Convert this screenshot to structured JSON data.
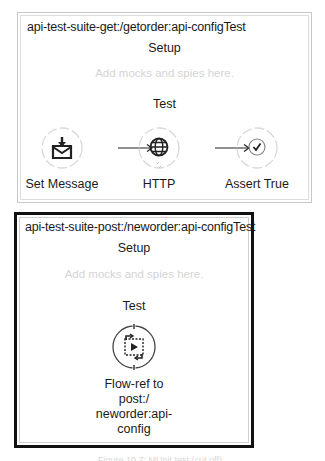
{
  "panels": [
    {
      "title": "api-test-suite-get:/getorder:api-configTest",
      "setup_label": "Setup",
      "setup_hint": "Add mocks and spies here.",
      "test_label": "Test",
      "steps": [
        {
          "label": "Set Message",
          "icon": "set-message-icon"
        },
        {
          "label": "HTTP",
          "icon": "globe-icon"
        },
        {
          "label": "Assert True",
          "icon": "check-icon"
        }
      ],
      "border_color": "#c8c8c8"
    },
    {
      "title": "api-test-suite-post:/neworder:api-configTest",
      "setup_label": "Setup",
      "setup_hint": "Add mocks and spies here.",
      "test_label": "Test",
      "steps": [
        {
          "label_lines": [
            "Flow-ref to post:/",
            "neworder:api-",
            "config"
          ],
          "icon": "flow-ref-icon"
        }
      ],
      "border_color": "#111111",
      "selected": true
    }
  ],
  "caption": "Figure 10.7: MUnit test (cut off)"
}
